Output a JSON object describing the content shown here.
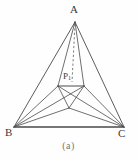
{
  "figure": {
    "caption": "(a)",
    "kind": "geometry-diagram",
    "background_color": "#fefefe",
    "stroke_color": "#4a4a4a",
    "label_color": "#3a3a3a",
    "caption_color": "#777777",
    "labels": {
      "apex": "A",
      "base_left": "B",
      "base_right": "C",
      "inner_point": "P",
      "inner_point_subscript": "1"
    },
    "points": {
      "A": {
        "x": 75,
        "y": 22
      },
      "B": {
        "x": 14,
        "y": 127
      },
      "C": {
        "x": 124,
        "y": 127
      },
      "O": {
        "x": 69,
        "y": 108
      },
      "L": {
        "x": 58,
        "y": 86
      },
      "R": {
        "x": 84,
        "y": 86
      },
      "D": {
        "x": 72,
        "y": 82
      }
    },
    "solid_edges": [
      [
        "A",
        "B"
      ],
      [
        "A",
        "C"
      ],
      [
        "B",
        "C"
      ],
      [
        "A",
        "L"
      ],
      [
        "A",
        "R"
      ],
      [
        "L",
        "R"
      ],
      [
        "L",
        "O"
      ],
      [
        "R",
        "O"
      ],
      [
        "B",
        "O"
      ],
      [
        "C",
        "O"
      ],
      [
        "B",
        "L"
      ],
      [
        "C",
        "R"
      ],
      [
        "B",
        "R"
      ],
      [
        "C",
        "L"
      ]
    ],
    "dashed_edges": [
      [
        "A",
        "D"
      ]
    ]
  }
}
